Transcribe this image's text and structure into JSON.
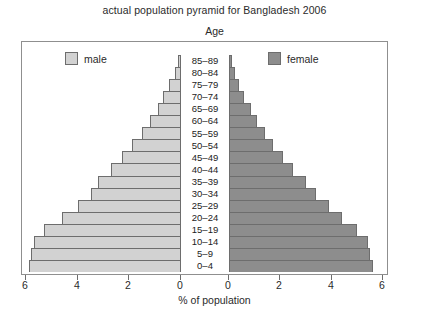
{
  "chart_data": {
    "type": "bar",
    "subtype": "population-pyramid",
    "title": "actual population pyramid for Bangladesh 2006",
    "xlabel": "% of population",
    "ylabel": "Age",
    "categories": [
      "0-4",
      "5-9",
      "10-14",
      "15-19",
      "20-24",
      "25-29",
      "30-34",
      "35-39",
      "40-44",
      "45-49",
      "50-54",
      "55-59",
      "60-64",
      "65-69",
      "70-74",
      "75-79",
      "80-84",
      "85-89"
    ],
    "series": [
      {
        "name": "male",
        "color": "#d2d2d2",
        "axis_direction": "left",
        "values": [
          5.9,
          5.8,
          5.7,
          5.3,
          4.6,
          4.0,
          3.5,
          3.2,
          2.7,
          2.3,
          1.9,
          1.5,
          1.2,
          0.9,
          0.7,
          0.45,
          0.25,
          0.12
        ]
      },
      {
        "name": "female",
        "color": "#8d8d8d",
        "axis_direction": "right",
        "values": [
          5.6,
          5.5,
          5.4,
          5.0,
          4.4,
          3.9,
          3.4,
          3.0,
          2.5,
          2.1,
          1.7,
          1.4,
          1.1,
          0.85,
          0.6,
          0.4,
          0.22,
          0.1
        ]
      }
    ],
    "xlim": [
      0,
      6
    ],
    "xticks": [
      6,
      4,
      2,
      0
    ],
    "xticks_right": [
      0,
      2,
      4,
      6
    ],
    "grid": false,
    "legend_position": "inside-top"
  },
  "legend": {
    "male_label": "male",
    "female_label": "female"
  },
  "axis": {
    "age_title": "Age",
    "x_title": "% of population",
    "left_ticks": [
      "6",
      "4",
      "2",
      "0"
    ],
    "right_ticks": [
      "0",
      "2",
      "4",
      "6"
    ]
  },
  "colors": {
    "male": "#d2d2d2",
    "female": "#8d8d8d",
    "outline": "#6d6d6d",
    "frame": "#8f8f8f",
    "background": "#ffffff"
  }
}
